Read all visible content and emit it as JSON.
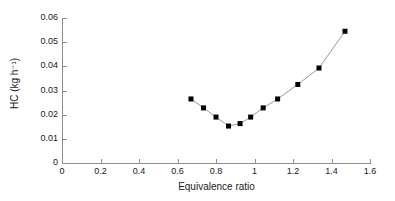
{
  "chart_data": {
    "type": "line",
    "title": "",
    "xlabel": "Equivalence ratio",
    "ylabel": "HC (kg h⁻¹)",
    "xlim": [
      0,
      1.6
    ],
    "ylim": [
      0,
      0.06
    ],
    "xticks": [
      "0",
      "0.2",
      "0.4",
      "0.6",
      "0.8",
      "1",
      "1.2",
      "1.4",
      "1.6"
    ],
    "xtick_values": [
      0,
      0.2,
      0.4,
      0.6,
      0.8,
      1.0,
      1.2,
      1.4,
      1.6
    ],
    "yticks": [
      "0",
      "0.01",
      "0.02",
      "0.03",
      "0.04",
      "0.05",
      "0.06"
    ],
    "ytick_values": [
      0,
      0.01,
      0.02,
      0.03,
      0.04,
      0.05,
      0.06
    ],
    "grid": false,
    "legend": false,
    "marker": "filled-square",
    "marker_color": "#000000",
    "line_color": "#9a9a9a",
    "axis_color": "#8d8d8d",
    "series": [
      {
        "name": "HC",
        "x": [
          0.67,
          0.735,
          0.8,
          0.865,
          0.925,
          0.98,
          1.045,
          1.12,
          1.225,
          1.335,
          1.47
        ],
        "y": [
          0.0265,
          0.0228,
          0.019,
          0.0153,
          0.0163,
          0.019,
          0.0228,
          0.0265,
          0.0325,
          0.0393,
          0.0545
        ]
      }
    ],
    "points": [
      {
        "x": 0.67,
        "y": 0.0265
      },
      {
        "x": 0.735,
        "y": 0.0228
      },
      {
        "x": 0.8,
        "y": 0.019
      },
      {
        "x": 0.865,
        "y": 0.0153
      },
      {
        "x": 0.925,
        "y": 0.0163
      },
      {
        "x": 0.98,
        "y": 0.019
      },
      {
        "x": 1.045,
        "y": 0.0228
      },
      {
        "x": 1.12,
        "y": 0.0265
      },
      {
        "x": 1.225,
        "y": 0.0325
      },
      {
        "x": 1.335,
        "y": 0.0393
      },
      {
        "x": 1.47,
        "y": 0.0545
      }
    ]
  }
}
